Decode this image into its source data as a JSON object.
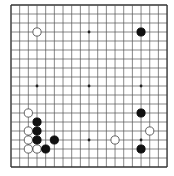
{
  "board": {
    "size": 19,
    "origin_x": 11,
    "origin_y": 5,
    "step_x": 8.67,
    "step_y": 9.0,
    "line_color": "#555555",
    "edge_color": "#333333",
    "background": "#ffffff",
    "star_points": [
      [
        3,
        3
      ],
      [
        9,
        3
      ],
      [
        15,
        3
      ],
      [
        3,
        9
      ],
      [
        9,
        9
      ],
      [
        15,
        9
      ],
      [
        3,
        15
      ],
      [
        9,
        15
      ],
      [
        15,
        15
      ]
    ],
    "stones": [
      {
        "color": "white",
        "col": 3,
        "row": 3
      },
      {
        "color": "black",
        "col": 15,
        "row": 3
      },
      {
        "color": "white",
        "col": 2,
        "row": 12
      },
      {
        "color": "black",
        "col": 15,
        "row": 12
      },
      {
        "color": "black",
        "col": 3,
        "row": 13
      },
      {
        "color": "white",
        "col": 2,
        "row": 14
      },
      {
        "color": "black",
        "col": 3,
        "row": 14
      },
      {
        "color": "white",
        "col": 16,
        "row": 14
      },
      {
        "color": "white",
        "col": 2,
        "row": 15
      },
      {
        "color": "black",
        "col": 3,
        "row": 15
      },
      {
        "color": "black",
        "col": 5,
        "row": 15
      },
      {
        "color": "white",
        "col": 12,
        "row": 15
      },
      {
        "color": "white",
        "col": 2,
        "row": 16
      },
      {
        "color": "white",
        "col": 3,
        "row": 16
      },
      {
        "color": "black",
        "col": 4,
        "row": 16
      },
      {
        "color": "black",
        "col": 15,
        "row": 16
      }
    ]
  }
}
